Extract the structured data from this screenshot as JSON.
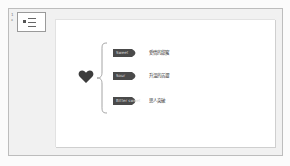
{
  "thumbnail_panel": {
    "slide_number": "1",
    "marker": "*"
  },
  "slide": {
    "icon": "heart-icon",
    "items": [
      {
        "tag": "Sweet",
        "text": "愛情的甜蜜"
      },
      {
        "tag": "Sour",
        "text": "升溫的苦澀"
      },
      {
        "tag": "Bitter sweet",
        "text": "思人突破"
      }
    ]
  },
  "colors": {
    "tag_fill": "#4a4a4a",
    "heart": "#3c3c3c",
    "brace": "#9a9a9a",
    "window_bg": "#f1f1f1",
    "slide_bg": "#ffffff"
  }
}
